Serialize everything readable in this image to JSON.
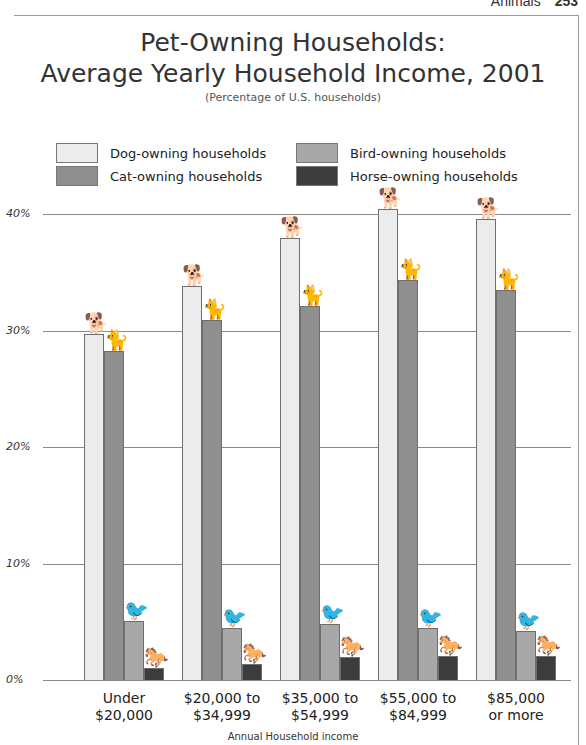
{
  "page_header": {
    "section": "Animals",
    "page_number": "253"
  },
  "chart_data": {
    "type": "bar",
    "title_lines": [
      "Pet-Owning Households:",
      "Average Yearly Household Income, 2001"
    ],
    "subtitle": "(Percentage of U.S. households)",
    "xlabel": "Annual Household income",
    "ylabel": "",
    "ylim": [
      0,
      40
    ],
    "yticks": [
      "0%",
      "10%",
      "20%",
      "30%",
      "40%"
    ],
    "grid": true,
    "legend_position": "top",
    "categories": [
      "Under $20,000",
      "$20,000 to $34,999",
      "$35,000 to $54,999",
      "$55,000 to $84,999",
      "$85,000 or more"
    ],
    "category_lines": [
      [
        "Under",
        "$20,000"
      ],
      [
        "$20,000 to",
        "$34,999"
      ],
      [
        "$35,000 to",
        "$54,999"
      ],
      [
        "$55,000 to",
        "$84,999"
      ],
      [
        "$85,000",
        "or more"
      ]
    ],
    "series": [
      {
        "name": "Dog-owning households",
        "color": "#ececec",
        "icon": "dog-icon",
        "glyph": "🐕",
        "values": [
          29.7,
          33.8,
          37.9,
          40.4,
          39.6
        ]
      },
      {
        "name": "Cat-owning households",
        "color": "#8f8f8f",
        "icon": "cat-icon",
        "glyph": "🐈",
        "values": [
          28.2,
          30.9,
          32.1,
          34.3,
          33.5
        ]
      },
      {
        "name": "Bird-owning households",
        "color": "#a8a8a8",
        "icon": "bird-icon",
        "glyph": "🐦",
        "values": [
          5.1,
          4.5,
          4.8,
          4.5,
          4.2
        ]
      },
      {
        "name": "Horse-owning households",
        "color": "#3c3c3c",
        "icon": "horse-icon",
        "glyph": "🐎",
        "values": [
          1.0,
          1.4,
          2.0,
          2.1,
          2.1
        ]
      }
    ]
  }
}
